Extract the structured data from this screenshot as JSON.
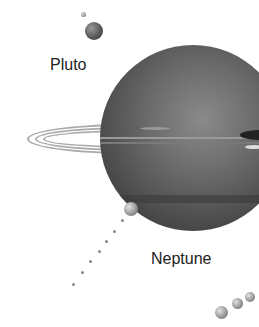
{
  "labels": {
    "pluto": "Pluto",
    "neptune": "Neptune"
  },
  "colors": {
    "background": "#ffffff",
    "planet": "#5a5a5a",
    "text": "#222222"
  }
}
